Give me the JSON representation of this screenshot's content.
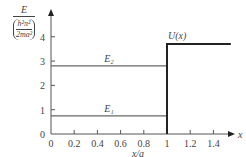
{
  "chart_data": {
    "type": "line",
    "title": "",
    "xlabel": "x/a",
    "ylabel": {
      "symbol": "E",
      "unit_numerator": "h²π²",
      "unit_denominator": "2ma²"
    },
    "xlim": [
      0,
      1.55
    ],
    "ylim": [
      0,
      4.3
    ],
    "x_ticks": [
      "0",
      "0.2",
      "0.4",
      "0.6",
      "0.8",
      "1",
      "1.2",
      "1.4"
    ],
    "x_tick_values": [
      0,
      0.2,
      0.4,
      0.6,
      0.8,
      1,
      1.2,
      1.4
    ],
    "y_ticks": [
      "0",
      "1",
      "2",
      "3",
      "4"
    ],
    "y_tick_values": [
      0,
      1,
      2,
      3,
      4
    ],
    "x_axis_end_label": "x",
    "series": [
      {
        "name": "E1",
        "label": "E₁",
        "kind": "energy-level",
        "x": [
          0,
          1
        ],
        "y": [
          0.75,
          0.75
        ]
      },
      {
        "name": "E2",
        "label": "E₂",
        "kind": "energy-level",
        "x": [
          0,
          1
        ],
        "y": [
          2.8,
          2.8
        ]
      },
      {
        "name": "U(x)",
        "label": "U(x)",
        "kind": "potential-step",
        "x": [
          1,
          1,
          1.55
        ],
        "y": [
          0,
          3.7,
          3.7
        ]
      }
    ],
    "grid": false,
    "legend": "none"
  }
}
